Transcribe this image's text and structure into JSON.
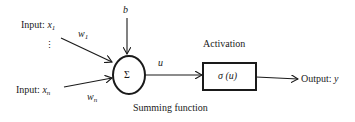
{
  "diagram": {
    "type": "neuron-model",
    "inputs": [
      {
        "label": "Input: ",
        "var": "x",
        "sub": "1",
        "weight": "w",
        "weight_sub": "1"
      },
      {
        "label": "Input: ",
        "var": "x",
        "sub": "n",
        "weight": "w",
        "weight_sub": "n"
      }
    ],
    "ellipsis": "⋮",
    "bias": "b",
    "summing_symbol": "Σ",
    "summing_label": "Summing function",
    "sum_output": "u",
    "activation_label": "Activation",
    "activation_func": "σ (u)",
    "output": {
      "label": "Output: ",
      "var": "y"
    },
    "colors": {
      "stroke": "#1a1a1a",
      "background": "#ffffff"
    }
  }
}
